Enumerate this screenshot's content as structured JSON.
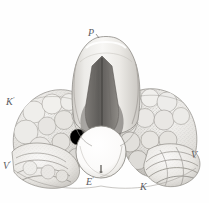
{
  "plate": {
    "caption": "Fig. 10.",
    "width": 209,
    "height": 203,
    "background_color": "#fefefe",
    "ink_color": "#5a5b5f",
    "style": "antique steel-engraving anatomical illustration"
  },
  "labels": {
    "prostate": "P",
    "kidney_left": "K",
    "kidney_left_prime": "′",
    "vesicle_left": "V",
    "vesicle_left_prime": "′",
    "vesicle_right": "V",
    "ejaculatory": "E",
    "ejaculatory_prime": "′",
    "kidney_right": "K"
  },
  "callouts": [
    {
      "id": "P",
      "text": "P",
      "prime": "",
      "x": 88,
      "y": 28
    },
    {
      "id": "K1",
      "text": "K",
      "prime": "′",
      "x": 6,
      "y": 97
    },
    {
      "id": "V1",
      "text": "V",
      "prime": "′",
      "x": 3,
      "y": 161
    },
    {
      "id": "V2",
      "text": "V",
      "prime": "",
      "x": 191,
      "y": 150
    },
    {
      "id": "E1",
      "text": "E",
      "prime": "′",
      "x": 86,
      "y": 177
    },
    {
      "id": "K2",
      "text": "K",
      "prime": "",
      "x": 140,
      "y": 182
    }
  ],
  "palette": {
    "paper": "#fefefe",
    "light_tint": "#f2f1ef",
    "mid_tint": "#d9d7d3",
    "shadow": "#a9a6a1",
    "deep_shadow": "#6f6c68",
    "cleft_dark": "#5c5a57",
    "outline": "#8a8782",
    "highlight": "#ffffff"
  }
}
